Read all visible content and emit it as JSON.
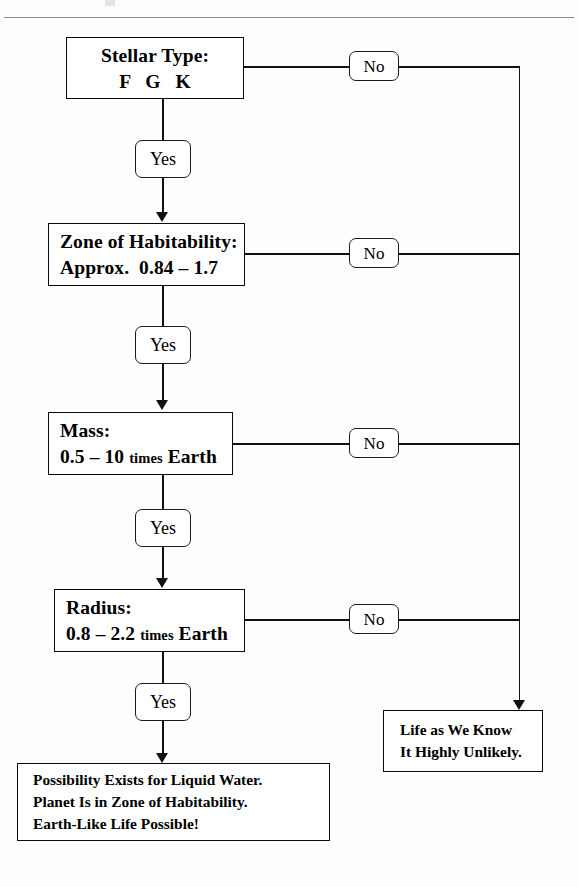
{
  "diagram": {
    "ink_color": "#111111",
    "rule_color": "#8b8b8b",
    "background": "#fdfdfd"
  },
  "decisions": [
    {
      "id": "stellar-type",
      "line1": "Stellar Type:",
      "line2": "F   G   K",
      "yes_label": "Yes",
      "no_label": "No"
    },
    {
      "id": "zone-of-habitability",
      "line1": "Zone of Habitability:",
      "line2": "Approx.  0.84 – 1.7",
      "yes_label": "Yes",
      "no_label": "No"
    },
    {
      "id": "mass",
      "line1": "Mass:",
      "line2_a": "0.5 – 10 ",
      "line2_small": "times",
      "line2_b": " Earth",
      "yes_label": "Yes",
      "no_label": "No"
    },
    {
      "id": "radius",
      "line1": "Radius:",
      "line2_a": "0.8 – 2.2 ",
      "line2_small": "times",
      "line2_b": " Earth",
      "yes_label": "Yes",
      "no_label": "No"
    }
  ],
  "outcomes": {
    "positive": {
      "line1": "Possibility Exists for Liquid Water.",
      "line2": "Planet Is in Zone of Habitability.",
      "line3": "Earth-Like Life Possible!"
    },
    "negative": {
      "line1": "Life as We Know",
      "line2": "It Highly Unlikely."
    }
  }
}
